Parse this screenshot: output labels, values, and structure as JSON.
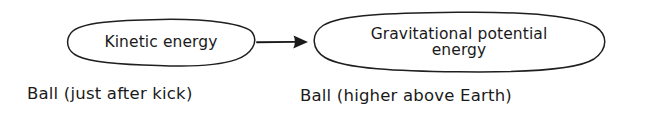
{
  "diagram": {
    "background_color": "#ffffff",
    "ink_color": "#1a1a1a",
    "style": "hand-drawn",
    "nodes": [
      {
        "id": "kinetic",
        "label": "Kinetic energy",
        "shape": "ellipse",
        "caption": "Ball (just after kick)"
      },
      {
        "id": "gravitational_potential",
        "label": "Gravitational potential\nenergy",
        "shape": "ellipse",
        "caption": "Ball (higher above Earth)"
      }
    ],
    "arrow": {
      "name": "energy-transfer-arrow",
      "from": "kinetic",
      "to": "gravitational_potential",
      "direction": "right",
      "label": ""
    }
  }
}
